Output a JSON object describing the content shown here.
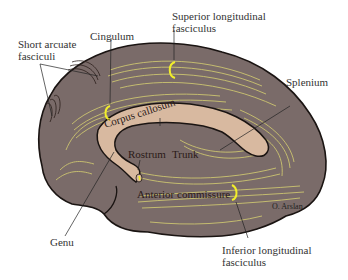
{
  "figure": {
    "colors": {
      "brain_fill": "#7a6b69",
      "fiber": "#d6cf72",
      "corpus_callosum": "#d8b9a0",
      "outline": "#1a1412",
      "bracket": "#f2ee2a"
    },
    "labels": {
      "superior_longitudinal_1": "Superior longitudinal",
      "superior_longitudinal_2": "fasciculus",
      "short_arcuate_1": "Short arcuate",
      "short_arcuate_2": "fasciculi",
      "cingulum": "Cingulum",
      "splenium": "Splenium",
      "corpus_callosum": "Corpus callosum",
      "rostrum": "Rostrum",
      "trunk": "Trunk",
      "anterior_commissure": "Anterior commissure",
      "genu": "Genu",
      "inferior_longitudinal_1": "Inferior longitudinal",
      "inferior_longitudinal_2": "fasciculus",
      "signature": "O. Arslan"
    }
  }
}
